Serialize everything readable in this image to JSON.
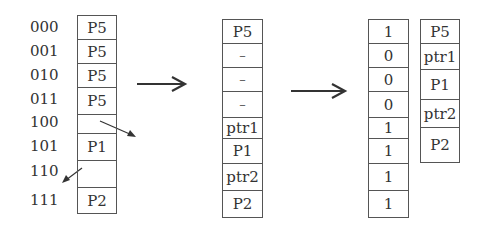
{
  "diagram": {
    "title": "",
    "stage1": {
      "addresses": [
        "000",
        "001",
        "010",
        "011",
        "100",
        "101",
        "110",
        "111"
      ],
      "cells": [
        "P5",
        "P5",
        "P5",
        "P5",
        "",
        "P1",
        "",
        "P2"
      ]
    },
    "stage2": {
      "cells": [
        "P5",
        "–",
        "–",
        "–",
        "ptr1",
        "P1",
        "ptr2",
        "P2"
      ]
    },
    "stage3": {
      "bitmap": [
        "1",
        "0",
        "0",
        "0",
        "1",
        "1",
        "1",
        "1"
      ],
      "compact": [
        "P5",
        "ptr1",
        "P1",
        "ptr2",
        "P2"
      ]
    },
    "arrows": [
      "stage1-to-stage2",
      "stage2-to-stage3"
    ],
    "colors": {
      "line": "#555555",
      "text": "#333333",
      "background": "#ffffff"
    }
  }
}
